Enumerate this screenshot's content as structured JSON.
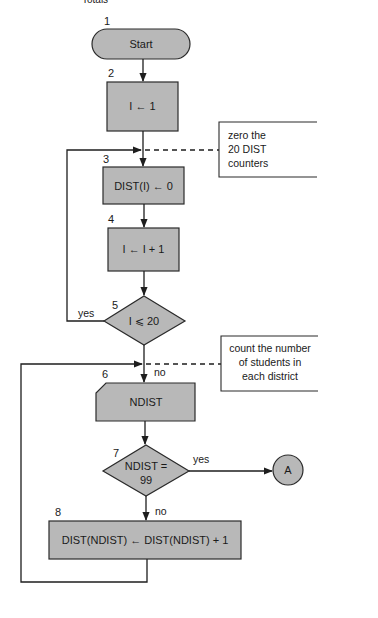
{
  "header": {
    "clipped_title": "Totals"
  },
  "colors": {
    "fill": "#b8b8b8",
    "stroke": "#1e1e1e",
    "background": "#ffffff"
  },
  "nodes": [
    {
      "id": 1,
      "number": "1",
      "type": "terminator",
      "text": "Start"
    },
    {
      "id": 2,
      "number": "2",
      "type": "process",
      "text": "I ← 1"
    },
    {
      "id": 3,
      "number": "3",
      "type": "process",
      "text": "DIST(I) ← 0"
    },
    {
      "id": 4,
      "number": "4",
      "type": "process",
      "text": "I ← I + 1"
    },
    {
      "id": 5,
      "number": "5",
      "type": "decision",
      "text": "I ⩽ 20"
    },
    {
      "id": 6,
      "number": "6",
      "type": "input-card",
      "text": "NDIST"
    },
    {
      "id": 7,
      "number": "7",
      "type": "decision",
      "text_line1": "NDIST =",
      "text_line2": "99"
    },
    {
      "id": 8,
      "number": "8",
      "type": "process",
      "text": "DIST(NDIST) ← DIST(NDIST) + 1"
    },
    {
      "id": "A",
      "type": "connector",
      "text": "A"
    }
  ],
  "edges": {
    "yes5": "yes",
    "no5": "no",
    "yes7": "yes",
    "no7": "no"
  },
  "annotations": [
    {
      "lines": [
        "zero the",
        "20 DIST",
        "counters"
      ]
    },
    {
      "lines": [
        "count the number",
        "of students in",
        "each district"
      ]
    }
  ]
}
